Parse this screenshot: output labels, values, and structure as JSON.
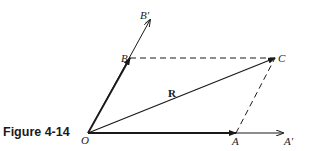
{
  "figure": {
    "caption": "Figure 4-14"
  },
  "points": {
    "O": {
      "label": "O",
      "x": 88,
      "y": 133
    },
    "A": {
      "label": "A",
      "x": 236,
      "y": 133
    },
    "A_prime": {
      "label": "A′",
      "x": 283,
      "y": 133
    },
    "B": {
      "label": "B",
      "x": 130,
      "y": 58
    },
    "B_prime": {
      "label": "B′",
      "x": 150,
      "y": 20
    },
    "C": {
      "label": "C",
      "x": 275,
      "y": 58
    }
  },
  "vectors": {
    "resultant_label": "R"
  },
  "colors": {
    "ink": "#1a1a1a",
    "background": "#ffffff"
  }
}
